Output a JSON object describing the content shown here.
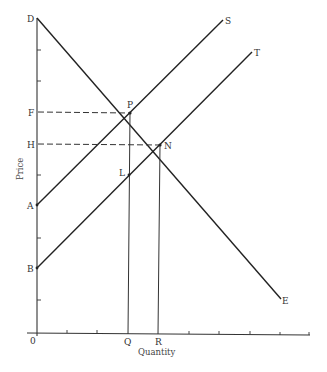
{
  "diagram": {
    "title": "",
    "axes": {
      "x_label": "Quantity",
      "y_label": "Price",
      "origin_label": "0"
    },
    "point_labels": {
      "D": "D",
      "F": "F",
      "H": "H",
      "A": "A",
      "B": "B",
      "P": "P",
      "N": "N",
      "L": "L",
      "S": "S",
      "T": "T",
      "E": "E",
      "Q": "Q",
      "R": "R"
    },
    "curves": [
      {
        "name": "demand",
        "from": "D",
        "to": "E",
        "description": "Downward sloping demand curve DE"
      },
      {
        "name": "supply-S",
        "from": "A",
        "to": "S",
        "description": "Upward sloping supply curve AS"
      },
      {
        "name": "supply-T",
        "from": "B",
        "to": "T",
        "description": "Upward sloping supply curve BT"
      }
    ],
    "intersections": [
      {
        "label": "P",
        "curves": [
          "demand",
          "supply-S"
        ],
        "price_label": "F",
        "quantity_label": "Q"
      },
      {
        "label": "N",
        "curves": [
          "demand",
          "supply-T"
        ],
        "price_label": "H",
        "quantity_label": "R"
      },
      {
        "label": "L",
        "curves": [
          "supply-T"
        ],
        "note": "Point on BT directly below P"
      }
    ]
  }
}
